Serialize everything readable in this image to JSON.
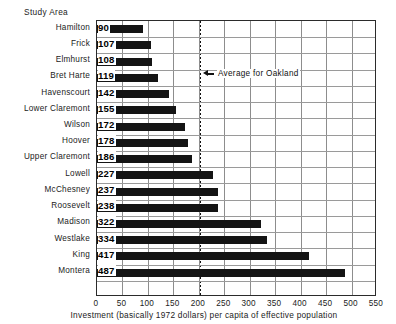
{
  "chart_data": {
    "type": "bar",
    "orientation": "horizontal",
    "title": "Study Area",
    "xlabel": "Investment (basically 1972 dollars) per capita of effective population",
    "ylabel": "",
    "xlim": [
      0,
      550
    ],
    "xticks": [
      0,
      50,
      100,
      150,
      200,
      250,
      300,
      350,
      400,
      450,
      500,
      550
    ],
    "xtick_labels": [
      "0",
      "50",
      "100",
      "150",
      "200",
      "250",
      "300",
      "350",
      "400",
      "450",
      "500",
      "550"
    ],
    "grid": true,
    "legend": null,
    "categories": [
      "Hamilton",
      "Frick",
      "Elmhurst",
      "Bret Harte",
      "Havenscourt",
      "Lower Claremont",
      "Wilson",
      "Hoover",
      "Upper Claremont",
      "Lowell",
      "McChesney",
      "Roosevelt",
      "Madison",
      "Westlake",
      "King",
      "Montera"
    ],
    "values": [
      90,
      107,
      108,
      119,
      142,
      155,
      172,
      178,
      186,
      227,
      237,
      238,
      322,
      334,
      417,
      487
    ],
    "value_labels": [
      "90",
      "107",
      "108",
      "119",
      "142",
      "155",
      "172",
      "178",
      "186",
      "227",
      "237",
      "238",
      "322",
      "334",
      "417",
      "487"
    ],
    "annotations": [
      {
        "text": "Average for Oakland",
        "value": 200,
        "style": "dotted-vertical-line-with-left-arrow"
      }
    ],
    "colors": {
      "bar": "#141414",
      "grid": "#9a9a9a",
      "frame": "#2b2b2b",
      "text": "#1b1b1b",
      "background": "#ffffff"
    }
  }
}
